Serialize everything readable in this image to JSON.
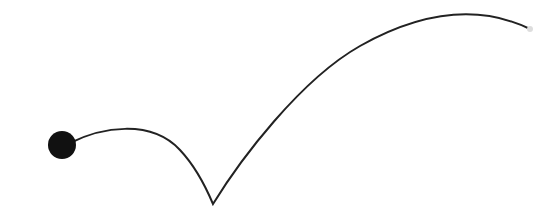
{
  "diagram": {
    "colors": {
      "background": "#ffffff",
      "path": "#222222",
      "ball": "#111111",
      "end_marker": "#dddddd"
    },
    "ball": {
      "cx": 62,
      "cy": 145,
      "r": 14
    },
    "path": {
      "d": "M 70 143 C 100 128, 150 118, 180 150 C 195 166, 205 185, 213 204 C 240 160, 300 80, 360 46 C 410 18, 470 0, 530 29",
      "stroke_width": 2
    },
    "end_point": {
      "cx": 530,
      "cy": 29,
      "r": 3
    }
  }
}
